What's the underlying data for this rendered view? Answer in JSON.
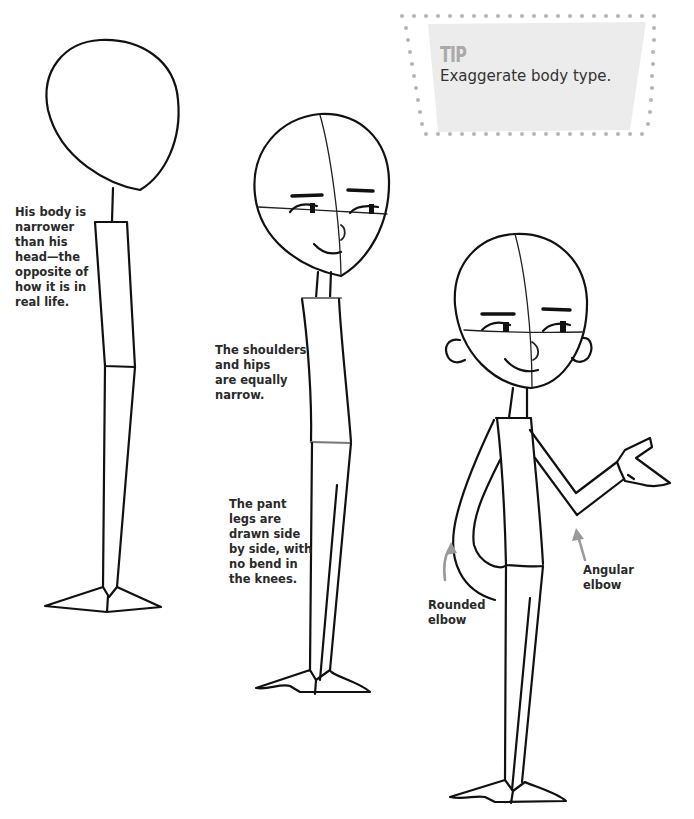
{
  "tip": {
    "title": "TIP",
    "text": "Exaggerate body type.",
    "bg_color": "#ececec",
    "dot_color": "#b5b5b5"
  },
  "captions": {
    "body_narrower": [
      "His body is",
      "narrower",
      "than his",
      "head—the",
      "opposite of",
      "how it is in",
      "real life."
    ],
    "shoulders_hips": [
      "The shoulders",
      "and hips",
      "are equally",
      "narrow."
    ],
    "pant_legs": [
      "The pant",
      "legs are",
      "drawn side",
      "by side, with",
      "no bend in",
      "the knees."
    ],
    "rounded_elbow": [
      "Rounded",
      "elbow"
    ],
    "angular_elbow": [
      "Angular",
      "elbow"
    ]
  },
  "figures": [
    {
      "name": "stage-1-basic-shapes",
      "description": "Head oval with neck and simple body/leg blocks"
    },
    {
      "name": "stage-2-face-and-pants",
      "description": "Head with guidelines and facial features, pants legs drawn side by side"
    },
    {
      "name": "stage-3-arms-and-ears",
      "description": "Head with ears, arms with rounded and angular elbows, open hand"
    }
  ],
  "arrow_color": "#9a9a9a"
}
